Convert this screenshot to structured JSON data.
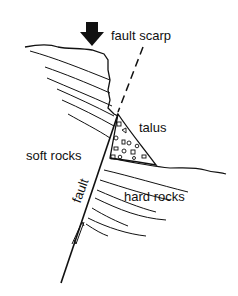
{
  "diagram": {
    "type": "geology cross-section",
    "labels": {
      "fault_scarp": "fault scarp",
      "talus": "talus",
      "soft_rocks": "soft rocks",
      "hard_rocks": "hard rocks",
      "fault": "fault"
    },
    "elements": [
      "down-arrow",
      "fault scarp dashed line",
      "talus wedge",
      "soft rock strata",
      "hard rock strata",
      "fault line",
      "relative motion half-arrows"
    ],
    "colors": {
      "ink": "#111111",
      "background": "#ffffff"
    }
  }
}
